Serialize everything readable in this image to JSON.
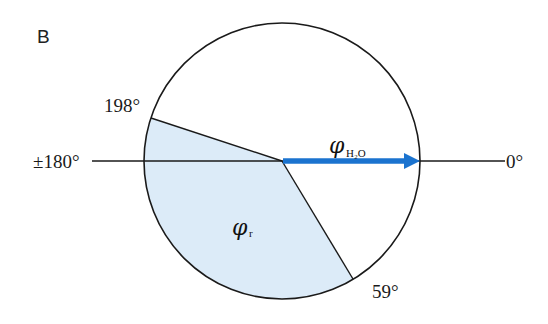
{
  "panel_label": "B",
  "colors": {
    "sector_fill": "#dcebf8",
    "arrow": "#1b73cf",
    "stroke": "#1a1a1a"
  },
  "circle": {
    "cx": 282,
    "cy": 161,
    "r": 138
  },
  "axis": {
    "left_label": "±180°",
    "right_label": "0°"
  },
  "sector": {
    "start_label": "198°",
    "end_label": "59°",
    "start_deg": 198,
    "end_deg": 59,
    "symbol": "φ",
    "subscript": "r"
  },
  "vector": {
    "symbol": "φ",
    "subscript": "H₂O",
    "direction_deg": 0
  }
}
